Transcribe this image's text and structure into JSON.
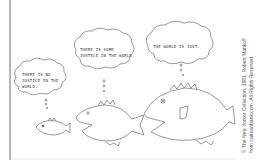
{
  "cartoon": {
    "bubbles": [
      {
        "text_line1": "THERE IS NO",
        "text_line2": "JUSTICE IN THE",
        "text_line3": "WORLD."
      },
      {
        "text_line1": "THERE IS SOME",
        "text_line2": "JUSTICE IN THE WORLD."
      },
      {
        "text_line1": "THE WORLD IS JUST."
      }
    ],
    "credit": {
      "line1": "© The New Yorker Collection, 1981, Robert Mankoff",
      "line2": "from cartoonbank.com. All Rights Reserved."
    }
  }
}
